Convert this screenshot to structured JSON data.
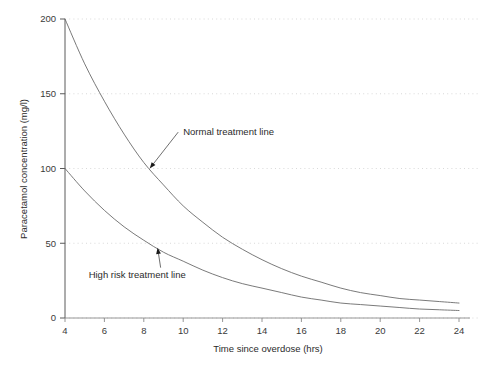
{
  "chart_data": {
    "type": "line",
    "title": "",
    "subtitle": "",
    "xlabel": "Time since overdose (hrs)",
    "ylabel": "Paracetamol concentration (mg/l)",
    "xlim": [
      4,
      24
    ],
    "ylim": [
      0,
      200
    ],
    "xticks": [
      4,
      6,
      8,
      10,
      12,
      14,
      16,
      18,
      20,
      22,
      24
    ],
    "yticks": [
      0,
      50,
      100,
      150,
      200
    ],
    "xtick_labels": [
      "4",
      "6",
      "8",
      "10",
      "12",
      "14",
      "16",
      "18",
      "20",
      "22",
      "24"
    ],
    "ytick_labels": [
      "0",
      "50",
      "100",
      "150",
      "200"
    ],
    "grid": "horizontal-dotted-faint",
    "legend": "none (inline annotations)",
    "x": [
      4,
      5,
      6,
      7,
      8,
      9,
      10,
      11,
      12,
      13,
      14,
      15,
      16,
      17,
      18,
      19,
      20,
      21,
      22,
      23,
      24
    ],
    "series": [
      {
        "name": "Normal treatment line",
        "color": "#6b6b6b",
        "values": [
          200,
          170,
          145,
          123,
          104,
          89,
          75,
          64,
          54,
          46,
          39,
          33,
          28,
          24,
          20,
          17,
          15,
          13,
          12,
          11,
          10
        ]
      },
      {
        "name": "High risk treatment line",
        "color": "#6b6b6b",
        "values": [
          100,
          85,
          72,
          61,
          52,
          44,
          38,
          32,
          27,
          23,
          20,
          17,
          14,
          12,
          10,
          9,
          8,
          7,
          6,
          5.5,
          5
        ]
      }
    ],
    "annotations": [
      {
        "text": "Normal treatment line",
        "text_x": 10.0,
        "text_y": 125,
        "point_x": 8.3,
        "point_y": 100
      },
      {
        "text": "High risk treatment line",
        "text_x": 5.2,
        "text_y": 29,
        "point_x": 8.7,
        "point_y": 47
      }
    ]
  }
}
